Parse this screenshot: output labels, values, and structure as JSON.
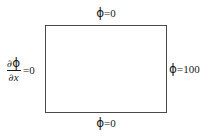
{
  "figure": {
    "type": "boundary-condition-diagram",
    "domain_shape": "rectangle",
    "background_color": "#ffffff",
    "line_color": "#4a4a4a",
    "text_color": "#1a1a1a"
  },
  "boundary_conditions": {
    "top": {
      "symbol": "ϕ",
      "relation": "=",
      "value": "0",
      "full_text": "ϕ=0",
      "kind": "dirichlet",
      "edge": "top"
    },
    "bottom": {
      "symbol": "ϕ",
      "relation": "=",
      "value": "0",
      "full_text": "ϕ=0",
      "kind": "dirichlet",
      "edge": "bottom"
    },
    "right": {
      "symbol": "ϕ",
      "relation": "=",
      "value": "100",
      "full_text": "ϕ=100",
      "kind": "dirichlet",
      "edge": "right"
    },
    "left": {
      "numerator_partial": "∂",
      "numerator_symbol": "ϕ",
      "denominator_partial": "∂",
      "denominator_symbol": "x",
      "relation": "=",
      "value": "0",
      "full_text": "∂ϕ/∂x =0",
      "kind": "neumann",
      "edge": "left"
    }
  }
}
